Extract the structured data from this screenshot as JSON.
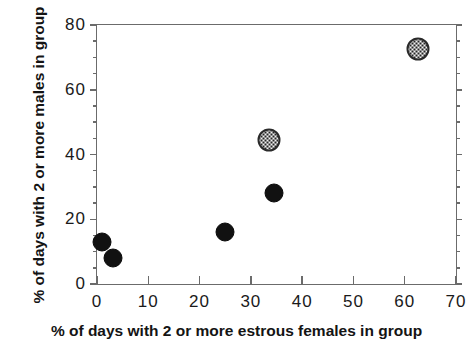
{
  "chart_data": {
    "type": "scatter",
    "title": "",
    "xlabel": "% of days with 2 or more estrous females in group",
    "ylabel": "% of days with 2 or more males in group",
    "xlim": [
      0,
      70
    ],
    "ylim": [
      0,
      80
    ],
    "xticks": [
      0,
      10,
      20,
      30,
      40,
      50,
      60,
      70
    ],
    "yticks": [
      0,
      20,
      40,
      60,
      80
    ],
    "x_minor_tick_step": 5,
    "y_minor_tick_step": 5,
    "grid": false,
    "legend": "none",
    "series": [
      {
        "name": "filled-circles",
        "marker": "filled-circle",
        "color": "#111111",
        "points": [
          {
            "x": 1.0,
            "y": 13.0
          },
          {
            "x": 3.2,
            "y": 8.0
          },
          {
            "x": 25.0,
            "y": 16.0
          },
          {
            "x": 34.5,
            "y": 28.0
          }
        ]
      },
      {
        "name": "stippled-circles",
        "marker": "stippled-circle",
        "color": "#f2f2f2",
        "points": [
          {
            "x": 33.5,
            "y": 44.5
          },
          {
            "x": 62.5,
            "y": 72.5
          }
        ]
      }
    ]
  },
  "axes": {
    "x_tick_labels": [
      "0",
      "10",
      "20",
      "30",
      "40",
      "50",
      "60",
      "70"
    ],
    "y_tick_labels": [
      "0",
      "20",
      "40",
      "60",
      "80"
    ]
  }
}
